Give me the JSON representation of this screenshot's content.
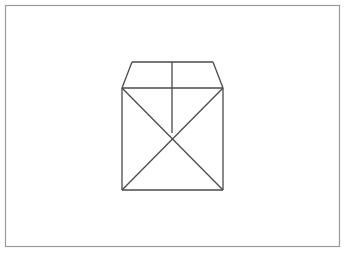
{
  "image": {
    "title": "Hand-drawn cube with open lid",
    "width": 351,
    "height": 256,
    "background_color": "#ffffff"
  },
  "frame": {
    "name": "page-border",
    "x": 5.5,
    "y": 5.5,
    "width": 334,
    "height": 241,
    "stroke_color": "#9a9a9a",
    "stroke_width": 1.2,
    "fill_color": "#ffffff"
  },
  "drawing": {
    "stroke_color": "#4a4a4a",
    "stroke_width": 1.3,
    "description": "Perspective line drawing of a box: a square front face crossed by two diagonals, topped by a trapezoidal lid split by a vertical center line.",
    "vertices": {
      "square_top_left": [
        122,
        88
      ],
      "square_top_right": [
        223,
        88
      ],
      "square_bottom_left": [
        122,
        190
      ],
      "square_bottom_right": [
        223,
        190
      ],
      "lid_top_left": [
        132,
        62
      ],
      "lid_top_right": [
        213,
        62
      ],
      "diagonal_crossing": [
        172,
        133
      ],
      "center_line_top": [
        172,
        62
      ],
      "center_line_bottom": [
        172,
        133
      ]
    },
    "strokes": [
      {
        "name": "square-top-edge",
        "points": "122,88 223,88"
      },
      {
        "name": "square-left-edge",
        "points": "122,88 122,190"
      },
      {
        "name": "square-right-edge",
        "points": "223,88 223,190"
      },
      {
        "name": "square-bottom-edge",
        "points": "122,190 223,190"
      },
      {
        "name": "lid-top-edge",
        "points": "132,62 213,62"
      },
      {
        "name": "lid-left-slant",
        "points": "132,62 122,88"
      },
      {
        "name": "lid-right-slant",
        "points": "213,62 223,88"
      },
      {
        "name": "lid-center-vertical",
        "points": "172,62 172,133"
      },
      {
        "name": "diagonal-tl-to-br",
        "points": "122,88 223,190"
      },
      {
        "name": "diagonal-tr-to-bl",
        "points": "223,88 122,190"
      }
    ]
  }
}
